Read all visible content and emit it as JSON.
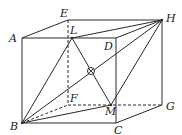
{
  "diagram": {
    "type": "geometry-cube",
    "colors": {
      "line": "#2a2a2a",
      "background": "#ffffff"
    },
    "vertices": {
      "A": {
        "label": "A",
        "x": 22,
        "y": 38,
        "lx": 9,
        "ly": 42
      },
      "E": {
        "label": "E",
        "x": 68,
        "y": 20,
        "lx": 60,
        "ly": 17
      },
      "H": {
        "label": "H",
        "x": 162,
        "y": 20,
        "lx": 166,
        "ly": 22
      },
      "D": {
        "label": "D",
        "x": 116,
        "y": 38,
        "lx": 104,
        "ly": 50
      },
      "B": {
        "label": "B",
        "x": 22,
        "y": 123,
        "lx": 10,
        "ly": 130
      },
      "C": {
        "label": "C",
        "x": 116,
        "y": 123,
        "lx": 114,
        "ly": 134
      },
      "G": {
        "label": "G",
        "x": 162,
        "y": 105,
        "lx": 166,
        "ly": 110
      },
      "F": {
        "label": "F",
        "x": 68,
        "y": 105,
        "lx": 70,
        "ly": 102
      },
      "L": {
        "label": "L",
        "x": 72,
        "y": 38,
        "lx": 70,
        "ly": 34
      },
      "M": {
        "label": "M",
        "x": 111,
        "y": 105,
        "lx": 105,
        "ly": 115
      },
      "O": {
        "label": "",
        "x": 91,
        "y": 71
      }
    },
    "solid_edges": [
      [
        "A",
        "E"
      ],
      [
        "E",
        "H"
      ],
      [
        "A",
        "D"
      ],
      [
        "D",
        "H"
      ],
      [
        "A",
        "B"
      ],
      [
        "D",
        "C"
      ],
      [
        "H",
        "G"
      ],
      [
        "B",
        "C"
      ],
      [
        "C",
        "G"
      ],
      [
        "B",
        "H"
      ],
      [
        "B",
        "L"
      ],
      [
        "B",
        "M"
      ],
      [
        "L",
        "H"
      ],
      [
        "L",
        "M"
      ],
      [
        "M",
        "H"
      ]
    ],
    "dashed_edges": [
      [
        "E",
        "F"
      ],
      [
        "F",
        "G"
      ],
      [
        "B",
        "F"
      ]
    ],
    "marker": {
      "point": "O",
      "type": "circle-cross",
      "radius": 3.5
    }
  }
}
